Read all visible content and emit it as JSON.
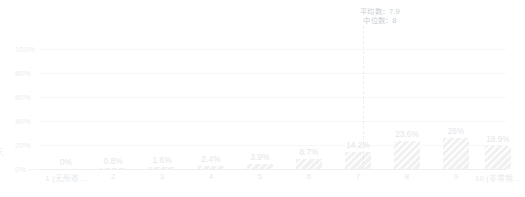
{
  "chart_data": {
    "type": "bar",
    "title": "",
    "subtitle": "",
    "xlabel": "",
    "ylabel": "",
    "ylim": [
      0,
      100
    ],
    "ytick_labels": [
      "100%",
      "80%",
      "60%",
      "40%",
      "20%",
      "0%"
    ],
    "ytick_values": [
      100,
      80,
      60,
      40,
      20,
      0
    ],
    "grid": true,
    "legend": "none",
    "categories": [
      "1 (无所收…",
      "2",
      "3",
      "4",
      "5",
      "6",
      "7",
      "8",
      "9",
      "10 (非常频…"
    ],
    "values": [
      0,
      0.8,
      1.6,
      2.4,
      3.9,
      8.7,
      14.2,
      23.6,
      26,
      18.9
    ],
    "value_labels": [
      "0%",
      "0.8%",
      "1.6%",
      "2.4%",
      "3.9%",
      "8.7%",
      "14.2%",
      "23.6%",
      "26%",
      "18.9%"
    ],
    "annotations": {
      "mean_label": "平均数：7.9",
      "median_label": "中位数：8",
      "mean_value": 7.9,
      "median_value": 8,
      "marker_category": "8"
    },
    "colors": {
      "bar_fill": "#ededed",
      "bar_hatch": "#dddddd",
      "gridline": "#e9edf0",
      "axis_text": "#c3ccd3",
      "value_text": "#b9c2c9",
      "annotation_text": "#7a8a99",
      "stat_line": "#d5dbe0",
      "background": "#ffffff"
    },
    "y_axis_title_clipped": "天"
  }
}
